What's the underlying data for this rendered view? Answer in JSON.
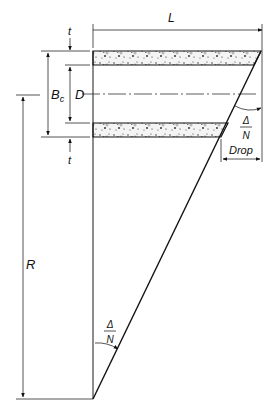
{
  "diagram": {
    "title": "",
    "labels": {
      "length": "L",
      "thickness_top": "t",
      "thickness_bottom": "t",
      "outer_diameter": "B",
      "outer_diameter_sub": "c",
      "inner_diameter": "D",
      "radius": "R",
      "drop": "Drop",
      "angle_top_num": "Δ",
      "angle_top_den": "N",
      "angle_bottom_num": "Δ",
      "angle_bottom_den": "N"
    }
  }
}
